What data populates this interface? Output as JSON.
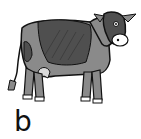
{
  "figure": {
    "colors": {
      "body": "#8a8a8a",
      "patch": "#4f4f4f",
      "outline": "#111111",
      "muzzle": "#ffffff",
      "udder": "#d9d9d9",
      "hooves": "#ffffff"
    }
  },
  "label": {
    "text": "b"
  }
}
